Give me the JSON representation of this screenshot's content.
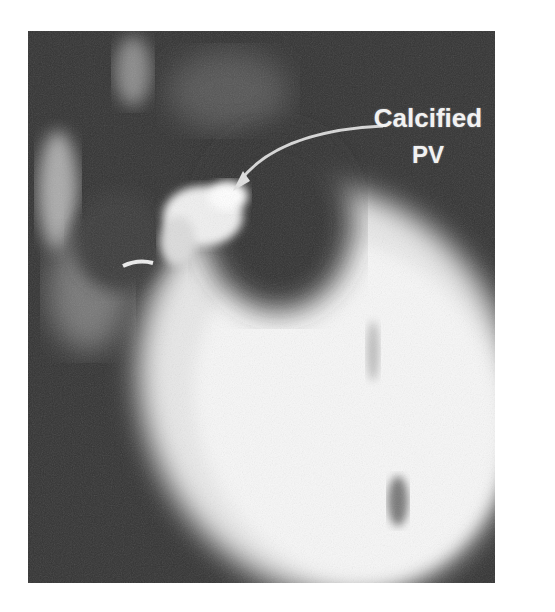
{
  "figure": {
    "type": "fluoroscopy / radiograph of heart",
    "annotation": {
      "line1": "Calcified",
      "line2": "PV"
    },
    "colors": {
      "background": "#ffffff",
      "image_dark": "#2e2e2e",
      "heart_bright": "#f4f4f4",
      "label": "#f2f2f2"
    }
  }
}
